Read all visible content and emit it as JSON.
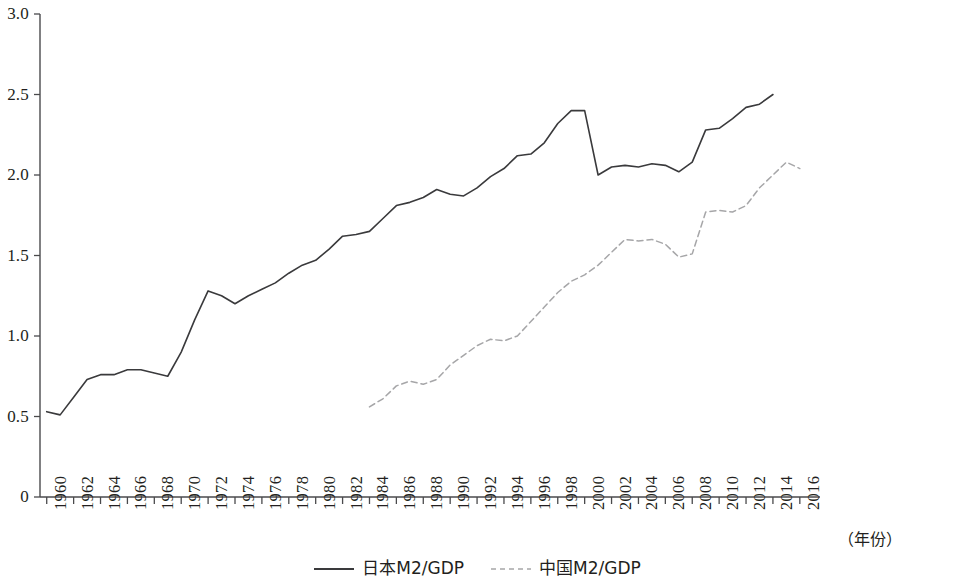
{
  "chart_data": {
    "type": "line",
    "title": "",
    "xlabel": "（年份）",
    "ylabel": "",
    "xlim": [
      1959.5,
      2017.5
    ],
    "ylim": [
      0,
      3.0
    ],
    "grid": false,
    "legend_position": "bottom-center",
    "y_ticks": [
      "0",
      "0.5",
      "1.0",
      "1.5",
      "2.0",
      "2.5",
      "3.0"
    ],
    "y_tick_values": [
      0,
      0.5,
      1.0,
      1.5,
      2.0,
      2.5,
      3.0
    ],
    "x_ticks": [
      "1960",
      "1962",
      "1964",
      "1966",
      "1968",
      "1970",
      "1972",
      "1974",
      "1976",
      "1978",
      "1980",
      "1982",
      "1984",
      "1986",
      "1988",
      "1990",
      "1992",
      "1994",
      "1996",
      "1998",
      "2000",
      "2002",
      "2004",
      "2006",
      "2008",
      "2010",
      "2012",
      "2014",
      "2016"
    ],
    "x_tick_values": [
      1960,
      1962,
      1964,
      1966,
      1968,
      1970,
      1972,
      1974,
      1976,
      1978,
      1980,
      1982,
      1984,
      1986,
      1988,
      1990,
      1992,
      1994,
      1996,
      1998,
      2000,
      2002,
      2004,
      2006,
      2008,
      2010,
      2012,
      2014,
      2016
    ],
    "series": [
      {
        "name": "日本M2/GDP",
        "style": "solid",
        "color": "#3a3a3c",
        "x": [
          1960,
          1961,
          1962,
          1963,
          1964,
          1965,
          1966,
          1967,
          1968,
          1969,
          1970,
          1971,
          1972,
          1973,
          1974,
          1975,
          1976,
          1977,
          1978,
          1979,
          1980,
          1981,
          1982,
          1983,
          1984,
          1985,
          1986,
          1987,
          1988,
          1989,
          1990,
          1991,
          1992,
          1993,
          1994,
          1995,
          1996,
          1997,
          1998,
          1999,
          2000,
          2001,
          2002,
          2003,
          2004,
          2005,
          2006,
          2007,
          2008,
          2009,
          2010,
          2011,
          2012,
          2013,
          2014
        ],
        "values": [
          0.53,
          0.51,
          0.62,
          0.73,
          0.76,
          0.76,
          0.79,
          0.79,
          0.77,
          0.75,
          0.9,
          1.1,
          1.28,
          1.25,
          1.2,
          1.25,
          1.29,
          1.33,
          1.39,
          1.44,
          1.47,
          1.54,
          1.62,
          1.63,
          1.65,
          1.73,
          1.81,
          1.83,
          1.86,
          1.91,
          1.88,
          1.87,
          1.92,
          1.99,
          2.04,
          2.12,
          2.13,
          2.2,
          2.32,
          2.4,
          2.4,
          2.0,
          2.05,
          2.06,
          2.05,
          2.07,
          2.06,
          2.02,
          2.08,
          2.28,
          2.29,
          2.35,
          2.42,
          2.44,
          2.5
        ]
      },
      {
        "name": "中国M2/GDP",
        "style": "dashed",
        "color": "#a6a6a8",
        "x": [
          1984,
          1985,
          1986,
          1987,
          1988,
          1989,
          1990,
          1991,
          1992,
          1993,
          1994,
          1995,
          1996,
          1997,
          1998,
          1999,
          2000,
          2001,
          2002,
          2003,
          2004,
          2005,
          2006,
          2007,
          2008,
          2009,
          2010,
          2011,
          2012,
          2013,
          2014,
          2015,
          2016
        ],
        "values": [
          0.56,
          0.61,
          0.69,
          0.72,
          0.7,
          0.73,
          0.82,
          0.88,
          0.94,
          0.98,
          0.97,
          1.0,
          1.09,
          1.18,
          1.27,
          1.34,
          1.38,
          1.44,
          1.52,
          1.6,
          1.59,
          1.6,
          1.57,
          1.49,
          1.51,
          1.77,
          1.78,
          1.77,
          1.81,
          1.92,
          2.0,
          2.08,
          2.04
        ]
      }
    ]
  },
  "legend": {
    "entries": [
      {
        "label": "日本M2/GDP",
        "style": "solid"
      },
      {
        "label": "中国M2/GDP",
        "style": "dashed"
      }
    ]
  },
  "axis": {
    "x_title": "（年份）"
  }
}
